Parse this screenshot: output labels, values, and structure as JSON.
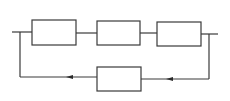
{
  "diagram": {
    "type": "block-diagram",
    "colors": {
      "line": "#3a3a3a",
      "background": "#ffffff"
    },
    "forward_blocks": [
      {
        "id": "block-1",
        "label": ""
      },
      {
        "id": "block-2",
        "label": ""
      },
      {
        "id": "block-3",
        "label": ""
      }
    ],
    "feedback_block": {
      "id": "feedback-block",
      "label": ""
    },
    "arrows": [
      {
        "id": "arrow-feedback-left",
        "direction": "left"
      },
      {
        "id": "arrow-feedback-right",
        "direction": "left"
      }
    ]
  }
}
